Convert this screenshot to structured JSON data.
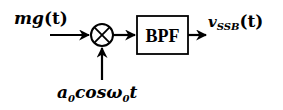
{
  "diagram": {
    "type": "block-diagram",
    "input": {
      "label_main": "mg",
      "label_arg": "(t)"
    },
    "mixer": {
      "symbol": "⊗",
      "name": "multiplier"
    },
    "carrier": {
      "a": "a",
      "a_sub": "0",
      "cos": "cos",
      "omega": "ω",
      "omega_sub": "0",
      "t": "t"
    },
    "filter": {
      "label": "BPF"
    },
    "output": {
      "v": "v",
      "sub": "SSB",
      "arg": "(t)"
    },
    "colors": {
      "stroke": "#000000",
      "background": "#ffffff"
    }
  }
}
